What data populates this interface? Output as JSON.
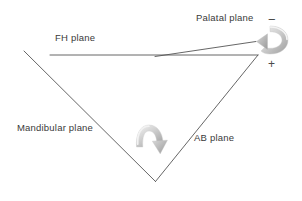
{
  "diagram": {
    "background_color": "#ffffff",
    "line_color": "#555555",
    "text_color": "#3a3a3a",
    "arrow_color_light": "#e8e8e8",
    "arrow_color_mid": "#bdbdbd",
    "arrow_color_dark": "#9a9a9a",
    "labels": {
      "fh_plane": "FH plane",
      "palatal_plane": "Palatal plane",
      "mandibular_plane": "Mandibular plane",
      "ab_plane": "AB plane",
      "minus_sign": "−",
      "plus_sign": "+"
    },
    "geometry": {
      "fh_plane_line": {
        "x1": 50,
        "y1": 55,
        "x2": 258,
        "y2": 55
      },
      "palatal_plane_line": {
        "x1": 155,
        "y1": 56,
        "x2": 256,
        "y2": 42
      },
      "mandibular_plane_line": {
        "x1": 24,
        "y1": 51,
        "x2": 155,
        "y2": 181
      },
      "ab_plane_line": {
        "x1": 155,
        "y1": 181,
        "x2": 258,
        "y2": 55
      }
    },
    "arrows": {
      "palatal_rotation": {
        "name": "counterclockwise-rotation-arrow",
        "center_x": 272,
        "center_y": 40,
        "direction": "counterclockwise"
      },
      "mandibular_rotation": {
        "name": "clockwise-rotation-arrow",
        "center_x": 150,
        "center_y": 135,
        "direction": "clockwise"
      }
    }
  }
}
